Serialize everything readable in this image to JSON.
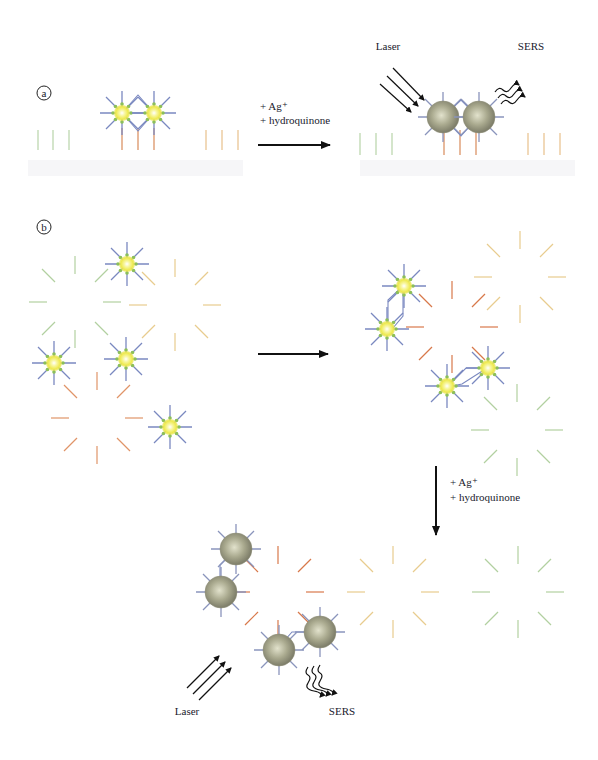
{
  "panels": {
    "a": {
      "marker": "a",
      "reagent_lines": [
        "+ Ag⁺",
        "+ hydroquinone"
      ],
      "laser_label": "Laser",
      "sers_label": "SERS"
    },
    "b": {
      "marker": "b",
      "reagent_lines": [
        "+ Ag⁺",
        "+ hydroquinone"
      ],
      "laser_label": "Laser",
      "sers_label": "SERS"
    }
  },
  "colors": {
    "quantum_dot_core": "#f4f060",
    "quantum_dot_center": "#ffffff",
    "dot_ligand": "#7a88c0",
    "dot_ligand_tip": "#8cbf5a",
    "silver_shell": "#9a9a80",
    "probe_green": "#a8cc90",
    "probe_orange": "#e8a070",
    "probe_red": "#d8703c",
    "probe_yellow": "#e8c880",
    "arrow": "#111111"
  }
}
